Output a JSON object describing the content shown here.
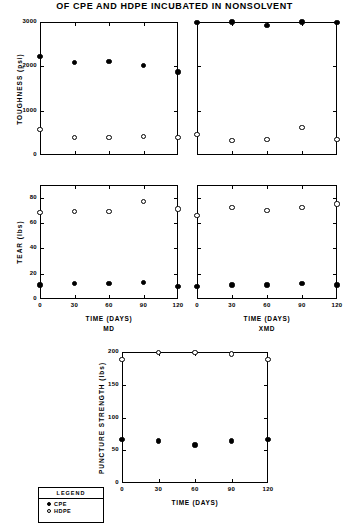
{
  "figure": {
    "title": "OF CPE AND HDPE INCUBATED IN NONSOLVENT"
  },
  "legend": {
    "title": "LEGEND",
    "entries": [
      {
        "marker": "filled-circle",
        "label": "CPE"
      },
      {
        "marker": "open-circle",
        "label": "HDPE"
      }
    ]
  },
  "chart_data": [
    {
      "id": "toughness-md",
      "type": "scatter",
      "title": "",
      "xlabel": "",
      "ylabel": "TOUGHNESS (psi)",
      "sublabel": "",
      "x": [
        0,
        30,
        60,
        90,
        120
      ],
      "xlim": [
        0,
        120
      ],
      "ylim": [
        0,
        3000
      ],
      "xticks": [
        0,
        30,
        60,
        90,
        120
      ],
      "xticklabels": [
        "",
        "",
        "",
        "",
        ""
      ],
      "yticks": [
        0,
        1000,
        2000,
        3000
      ],
      "yticklabels": [
        "0",
        "1000",
        "2000",
        "3000"
      ],
      "grid": false,
      "series": [
        {
          "name": "CPE",
          "marker": "filled-circle",
          "values": [
            2230,
            2080,
            2110,
            2010,
            1870
          ]
        },
        {
          "name": "HDPE",
          "marker": "open-circle",
          "values": [
            570,
            400,
            390,
            420,
            400
          ]
        }
      ]
    },
    {
      "id": "toughness-xmd",
      "type": "scatter",
      "title": "",
      "xlabel": "",
      "ylabel": "",
      "sublabel": "",
      "x": [
        0,
        30,
        60,
        90,
        120
      ],
      "xlim": [
        0,
        120
      ],
      "ylim": [
        0,
        3000
      ],
      "xticks": [
        0,
        30,
        60,
        90,
        120
      ],
      "xticklabels": [
        "",
        "",
        "",
        "",
        ""
      ],
      "yticks": [
        0,
        1000,
        2000,
        3000
      ],
      "yticklabels": [
        "",
        "",
        "",
        ""
      ],
      "grid": false,
      "series": [
        {
          "name": "CPE",
          "marker": "filled-circle",
          "values": [
            2990,
            3000,
            2930,
            3000,
            2980
          ]
        },
        {
          "name": "HDPE",
          "marker": "open-circle",
          "values": [
            470,
            330,
            350,
            620,
            350
          ]
        }
      ]
    },
    {
      "id": "tear-md",
      "type": "scatter",
      "title": "",
      "xlabel": "TIME (DAYS)",
      "sublabel": "MD",
      "ylabel": "TEAR (lbs)",
      "x": [
        0,
        30,
        60,
        90,
        120
      ],
      "xlim": [
        0,
        120
      ],
      "ylim": [
        0,
        90
      ],
      "xticks": [
        0,
        30,
        60,
        90,
        120
      ],
      "xticklabels": [
        "0",
        "30",
        "60",
        "90",
        "120"
      ],
      "yticks": [
        0,
        20,
        40,
        60,
        80
      ],
      "yticklabels": [
        "0",
        "20",
        "40",
        "60",
        "80"
      ],
      "grid": false,
      "series": [
        {
          "name": "CPE",
          "marker": "filled-circle",
          "values": [
            11,
            12,
            12,
            13,
            10
          ]
        },
        {
          "name": "HDPE",
          "marker": "open-circle",
          "values": [
            68,
            69,
            69,
            77,
            71
          ]
        }
      ]
    },
    {
      "id": "tear-xmd",
      "type": "scatter",
      "title": "",
      "xlabel": "TIME (DAYS)",
      "sublabel": "XMD",
      "ylabel": "",
      "x": [
        0,
        30,
        60,
        90,
        120
      ],
      "xlim": [
        0,
        120
      ],
      "ylim": [
        0,
        90
      ],
      "xticks": [
        0,
        30,
        60,
        90,
        120
      ],
      "xticklabels": [
        "0",
        "30",
        "60",
        "90",
        "120"
      ],
      "yticks": [
        0,
        20,
        40,
        60,
        80
      ],
      "yticklabels": [
        "",
        "",
        "",
        "",
        ""
      ],
      "grid": false,
      "series": [
        {
          "name": "CPE",
          "marker": "filled-circle",
          "values": [
            10,
            11,
            11,
            12,
            11
          ]
        },
        {
          "name": "HDPE",
          "marker": "open-circle",
          "values": [
            66,
            72,
            70,
            72,
            75
          ]
        }
      ]
    },
    {
      "id": "puncture-strength",
      "type": "scatter",
      "title": "",
      "xlabel": "TIME (DAYS)",
      "sublabel": "",
      "ylabel": "PUNCTURE STRENGTH (lbs)",
      "x": [
        0,
        30,
        60,
        90,
        120
      ],
      "xlim": [
        0,
        120
      ],
      "ylim": [
        0,
        200
      ],
      "xticks": [
        0,
        30,
        60,
        90,
        120
      ],
      "xticklabels": [
        "0",
        "30",
        "60",
        "90",
        "120"
      ],
      "yticks": [
        0,
        50,
        100,
        150,
        200
      ],
      "yticklabels": [
        "0",
        "50",
        "100",
        "150",
        "200"
      ],
      "grid": false,
      "series": [
        {
          "name": "CPE",
          "marker": "filled-circle",
          "values": [
            67,
            64,
            58,
            64,
            67
          ]
        },
        {
          "name": "HDPE",
          "marker": "open-circle",
          "values": [
            189,
            199,
            199,
            197,
            189
          ]
        }
      ]
    }
  ]
}
